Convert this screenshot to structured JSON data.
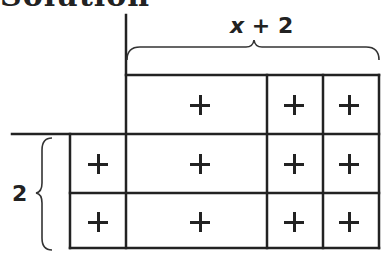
{
  "heading": {
    "text": "Solution"
  },
  "top_label": {
    "var": "x",
    "rest": " + 2"
  },
  "side_label": "2",
  "colors": {
    "line": "#222222",
    "background": "#ffffff"
  },
  "tiles": {
    "symbol": "+",
    "rows": [
      {
        "name": "x-row",
        "cells": [
          {
            "type": "x",
            "sign": "+"
          },
          {
            "type": "1",
            "sign": "+"
          },
          {
            "type": "1",
            "sign": "+"
          }
        ]
      },
      {
        "name": "unit-row-1",
        "cells": [
          {
            "type": "1",
            "sign": "+"
          },
          {
            "type": "x",
            "sign": "+"
          },
          {
            "type": "1",
            "sign": "+"
          },
          {
            "type": "1",
            "sign": "+"
          }
        ]
      },
      {
        "name": "unit-row-2",
        "cells": [
          {
            "type": "1",
            "sign": "+"
          },
          {
            "type": "x",
            "sign": "+"
          },
          {
            "type": "1",
            "sign": "+"
          },
          {
            "type": "1",
            "sign": "+"
          }
        ]
      }
    ]
  }
}
